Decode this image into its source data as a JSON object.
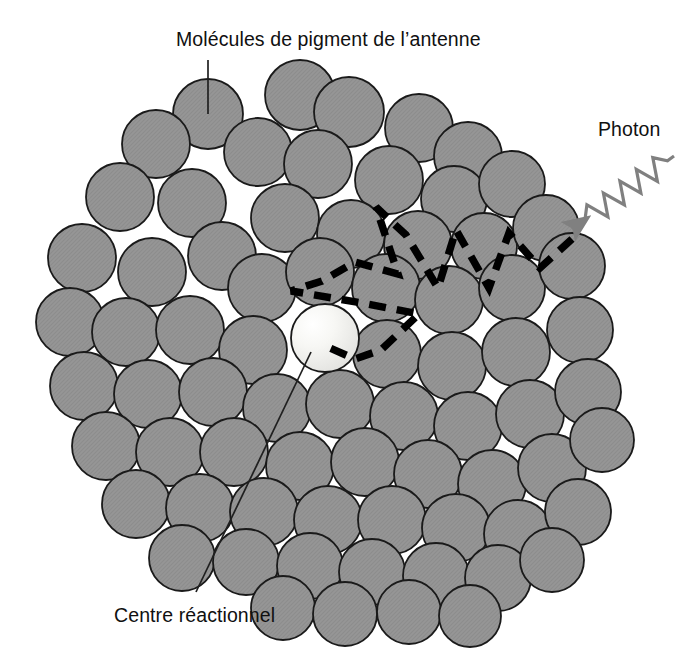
{
  "figure": {
    "kind": "schematic-diagram",
    "background_color": "#ffffff",
    "width": 700,
    "height": 653
  },
  "labels": {
    "antenna": "Molécules de pigment de l’antenne",
    "photon": "Photon",
    "reaction_center": "Centre réactionnel"
  },
  "colors": {
    "pigment_fill": "#969696",
    "pigment_stroke": "#1a1a1a",
    "reaction_center_fill": "#f6f6f4",
    "reaction_center_highlight": "#ffffff",
    "energy_path": "#000000",
    "photon_ray": "#808080",
    "leader_line": "#202020",
    "text": "#101010"
  },
  "leader_lines": {
    "antenna": {
      "x1": 208,
      "y1": 60,
      "x2": 208,
      "y2": 114
    },
    "reaction_center": {
      "x1": 311,
      "y1": 352,
      "x2": 196,
      "y2": 592
    }
  },
  "photon_ray": {
    "description": "gray zigzag wave with arrowhead pointing down-left into the antenna cluster",
    "start": {
      "x": 674,
      "y": 156
    },
    "arrow_tip": {
      "x": 572,
      "y": 229
    },
    "zigzag_peaks": 5,
    "stroke_width": 3.2
  },
  "energy_transfer_path": {
    "description": "thick black dashed zigzag tracing excitation hopping from the absorbing pigment to the reaction centre",
    "stroke_width": 7.5,
    "dash": "17 11",
    "points": [
      {
        "x": 572,
        "y": 239
      },
      {
        "x": 540,
        "y": 268
      },
      {
        "x": 509,
        "y": 233
      },
      {
        "x": 489,
        "y": 288
      },
      {
        "x": 456,
        "y": 230
      },
      {
        "x": 438,
        "y": 288
      },
      {
        "x": 406,
        "y": 235
      },
      {
        "x": 376,
        "y": 207
      },
      {
        "x": 398,
        "y": 274
      },
      {
        "x": 355,
        "y": 262
      },
      {
        "x": 322,
        "y": 281
      },
      {
        "x": 291,
        "y": 291
      },
      {
        "x": 362,
        "y": 303
      },
      {
        "x": 419,
        "y": 314
      },
      {
        "x": 381,
        "y": 350
      },
      {
        "x": 355,
        "y": 359
      },
      {
        "x": 323,
        "y": 345
      }
    ]
  },
  "reaction_center_molecule": {
    "cx": 325,
    "cy": 338,
    "r": 34
  },
  "pigment_molecules": [
    {
      "cx": 208,
      "cy": 114,
      "r": 35
    },
    {
      "cx": 300,
      "cy": 95,
      "r": 35
    },
    {
      "cx": 349,
      "cy": 112,
      "r": 35
    },
    {
      "cx": 419,
      "cy": 128,
      "r": 34
    },
    {
      "cx": 468,
      "cy": 156,
      "r": 34
    },
    {
      "cx": 156,
      "cy": 144,
      "r": 34
    },
    {
      "cx": 258,
      "cy": 152,
      "r": 34
    },
    {
      "cx": 318,
      "cy": 164,
      "r": 34
    },
    {
      "cx": 389,
      "cy": 180,
      "r": 34
    },
    {
      "cx": 454,
      "cy": 199,
      "r": 33
    },
    {
      "cx": 512,
      "cy": 184,
      "r": 33
    },
    {
      "cx": 120,
      "cy": 197,
      "r": 34
    },
    {
      "cx": 192,
      "cy": 203,
      "r": 34
    },
    {
      "cx": 222,
      "cy": 256,
      "r": 34
    },
    {
      "cx": 285,
      "cy": 218,
      "r": 34
    },
    {
      "cx": 351,
      "cy": 234,
      "r": 34
    },
    {
      "cx": 418,
      "cy": 245,
      "r": 34
    },
    {
      "cx": 484,
      "cy": 246,
      "r": 33
    },
    {
      "cx": 546,
      "cy": 228,
      "r": 33
    },
    {
      "cx": 82,
      "cy": 258,
      "r": 34
    },
    {
      "cx": 152,
      "cy": 272,
      "r": 34
    },
    {
      "cx": 262,
      "cy": 288,
      "r": 34
    },
    {
      "cx": 320,
      "cy": 272,
      "r": 34
    },
    {
      "cx": 386,
      "cy": 288,
      "r": 34
    },
    {
      "cx": 449,
      "cy": 300,
      "r": 34
    },
    {
      "cx": 512,
      "cy": 288,
      "r": 33
    },
    {
      "cx": 572,
      "cy": 266,
      "r": 33
    },
    {
      "cx": 70,
      "cy": 322,
      "r": 34
    },
    {
      "cx": 126,
      "cy": 332,
      "r": 34
    },
    {
      "cx": 190,
      "cy": 330,
      "r": 34
    },
    {
      "cx": 253,
      "cy": 350,
      "r": 34
    },
    {
      "cx": 387,
      "cy": 354,
      "r": 34
    },
    {
      "cx": 452,
      "cy": 366,
      "r": 34
    },
    {
      "cx": 516,
      "cy": 352,
      "r": 34
    },
    {
      "cx": 580,
      "cy": 330,
      "r": 33
    },
    {
      "cx": 84,
      "cy": 386,
      "r": 34
    },
    {
      "cx": 148,
      "cy": 394,
      "r": 34
    },
    {
      "cx": 213,
      "cy": 392,
      "r": 34
    },
    {
      "cx": 277,
      "cy": 408,
      "r": 34
    },
    {
      "cx": 340,
      "cy": 404,
      "r": 34
    },
    {
      "cx": 404,
      "cy": 416,
      "r": 34
    },
    {
      "cx": 468,
      "cy": 426,
      "r": 34
    },
    {
      "cx": 530,
      "cy": 414,
      "r": 34
    },
    {
      "cx": 588,
      "cy": 392,
      "r": 33
    },
    {
      "cx": 106,
      "cy": 446,
      "r": 34
    },
    {
      "cx": 170,
      "cy": 452,
      "r": 34
    },
    {
      "cx": 234,
      "cy": 452,
      "r": 34
    },
    {
      "cx": 300,
      "cy": 466,
      "r": 34
    },
    {
      "cx": 365,
      "cy": 462,
      "r": 34
    },
    {
      "cx": 428,
      "cy": 474,
      "r": 34
    },
    {
      "cx": 492,
      "cy": 484,
      "r": 34
    },
    {
      "cx": 552,
      "cy": 468,
      "r": 34
    },
    {
      "cx": 602,
      "cy": 440,
      "r": 32
    },
    {
      "cx": 136,
      "cy": 504,
      "r": 34
    },
    {
      "cx": 200,
      "cy": 508,
      "r": 34
    },
    {
      "cx": 264,
      "cy": 512,
      "r": 34
    },
    {
      "cx": 328,
      "cy": 520,
      "r": 34
    },
    {
      "cx": 392,
      "cy": 520,
      "r": 34
    },
    {
      "cx": 456,
      "cy": 528,
      "r": 34
    },
    {
      "cx": 518,
      "cy": 534,
      "r": 34
    },
    {
      "cx": 578,
      "cy": 512,
      "r": 33
    },
    {
      "cx": 182,
      "cy": 558,
      "r": 33
    },
    {
      "cx": 246,
      "cy": 562,
      "r": 33
    },
    {
      "cx": 310,
      "cy": 566,
      "r": 33
    },
    {
      "cx": 372,
      "cy": 572,
      "r": 33
    },
    {
      "cx": 436,
      "cy": 576,
      "r": 33
    },
    {
      "cx": 498,
      "cy": 578,
      "r": 33
    },
    {
      "cx": 552,
      "cy": 560,
      "r": 32
    },
    {
      "cx": 283,
      "cy": 608,
      "r": 32
    },
    {
      "cx": 345,
      "cy": 614,
      "r": 32
    },
    {
      "cx": 409,
      "cy": 612,
      "r": 32
    },
    {
      "cx": 470,
      "cy": 616,
      "r": 31
    }
  ]
}
